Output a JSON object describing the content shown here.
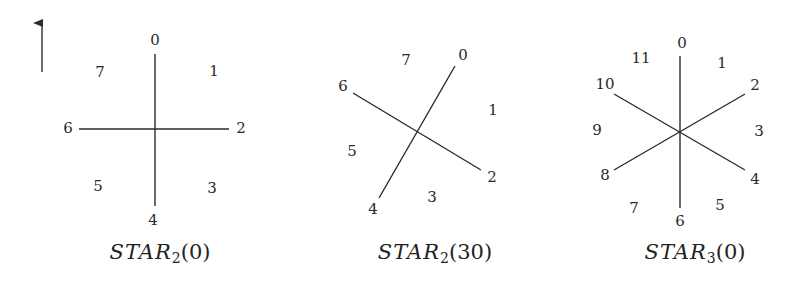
{
  "figure": {
    "orientation_arrow": {
      "x": 42,
      "y_tail": 72,
      "y_tip": 14
    },
    "stars": [
      {
        "name": "STAR2(0)",
        "caption": {
          "calligraphic": "STAR",
          "subscript": "2",
          "arg": "(0)",
          "x": 160,
          "y": 240
        },
        "center": [
          155,
          129
        ],
        "lines": [
          {
            "x1": 155,
            "y1": 54,
            "x2": 155,
            "y2": 206
          },
          {
            "x1": 79,
            "y1": 129,
            "x2": 229,
            "y2": 129
          }
        ],
        "labels": [
          {
            "text": "0",
            "x": 155,
            "y": 40
          },
          {
            "text": "1",
            "x": 214,
            "y": 71
          },
          {
            "text": "2",
            "x": 241,
            "y": 128
          },
          {
            "text": "3",
            "x": 212,
            "y": 188
          },
          {
            "text": "4",
            "x": 153,
            "y": 220
          },
          {
            "text": "5",
            "x": 98,
            "y": 186
          },
          {
            "text": "6",
            "x": 68,
            "y": 128
          },
          {
            "text": "7",
            "x": 100,
            "y": 72
          }
        ]
      },
      {
        "name": "STAR2(30)",
        "caption": {
          "calligraphic": "STAR",
          "subscript": "2",
          "arg": "(30)",
          "x": 435,
          "y": 240
        },
        "center": [
          417,
          132
        ],
        "lines": [
          {
            "x1": 455,
            "y1": 66,
            "x2": 379,
            "y2": 198
          },
          {
            "x1": 353,
            "y1": 93,
            "x2": 481,
            "y2": 170
          }
        ],
        "labels": [
          {
            "text": "0",
            "x": 463,
            "y": 55
          },
          {
            "text": "1",
            "x": 493,
            "y": 110
          },
          {
            "text": "2",
            "x": 492,
            "y": 177
          },
          {
            "text": "3",
            "x": 432,
            "y": 197
          },
          {
            "text": "4",
            "x": 373,
            "y": 209
          },
          {
            "text": "5",
            "x": 352,
            "y": 151
          },
          {
            "text": "6",
            "x": 343,
            "y": 86
          },
          {
            "text": "7",
            "x": 406,
            "y": 60
          }
        ]
      },
      {
        "name": "STAR3(0)",
        "caption": {
          "calligraphic": "STAR",
          "subscript": "3",
          "arg": "(0)",
          "x": 695,
          "y": 240
        },
        "center": [
          680,
          132
        ],
        "lines": [
          {
            "x1": 680,
            "y1": 56,
            "x2": 680,
            "y2": 208
          },
          {
            "x1": 614,
            "y1": 94,
            "x2": 745,
            "y2": 170
          },
          {
            "x1": 614,
            "y1": 170,
            "x2": 745,
            "y2": 94
          }
        ],
        "labels": [
          {
            "text": "0",
            "x": 682,
            "y": 43
          },
          {
            "text": "1",
            "x": 722,
            "y": 63
          },
          {
            "text": "2",
            "x": 755,
            "y": 85
          },
          {
            "text": "3",
            "x": 759,
            "y": 131
          },
          {
            "text": "4",
            "x": 755,
            "y": 179
          },
          {
            "text": "5",
            "x": 720,
            "y": 205
          },
          {
            "text": "6",
            "x": 680,
            "y": 221
          },
          {
            "text": "7",
            "x": 634,
            "y": 208
          },
          {
            "text": "8",
            "x": 605,
            "y": 175
          },
          {
            "text": "9",
            "x": 597,
            "y": 130
          },
          {
            "text": "10",
            "x": 605,
            "y": 84
          },
          {
            "text": "11",
            "x": 641,
            "y": 58
          }
        ]
      }
    ],
    "colors": {
      "line": "#2b2b2b",
      "text": "#2a2a2a",
      "background": "#ffffff"
    }
  }
}
